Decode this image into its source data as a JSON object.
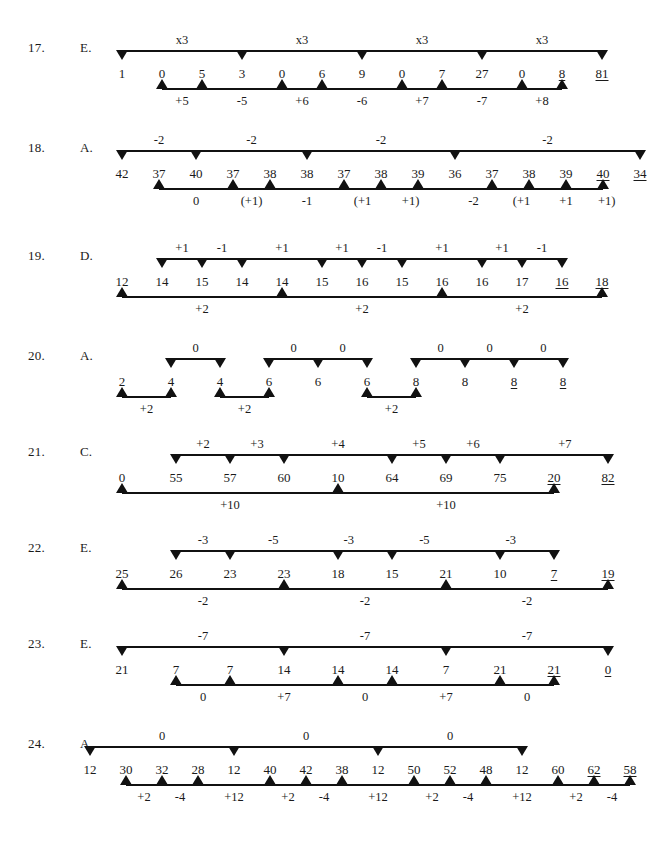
{
  "page": {
    "width": 666,
    "height": 847,
    "background": "#ffffff",
    "ink": "#111111"
  },
  "problems": [
    {
      "number": "17.",
      "answer": "E.",
      "y": 28,
      "seq_left": 122,
      "seq_step": 40,
      "numbers": [
        "1",
        "0",
        "5",
        "3",
        "0",
        "6",
        "9",
        "0",
        "7",
        "27",
        "0",
        "8",
        "81"
      ],
      "underlined": [
        11,
        12
      ],
      "top": {
        "spans": [
          [
            0,
            12
          ]
        ],
        "markers": [
          0,
          3,
          6,
          9,
          12
        ],
        "labels": [
          {
            "text": "x3",
            "at": 1.5
          },
          {
            "text": "x3",
            "at": 4.5
          },
          {
            "text": "x3",
            "at": 7.5
          },
          {
            "text": "x3",
            "at": 10.5
          }
        ]
      },
      "bottom": {
        "spans": [
          [
            1,
            11
          ]
        ],
        "markers": [
          1,
          2,
          4,
          5,
          7,
          8,
          10,
          11
        ],
        "labels": [
          {
            "text": "+5",
            "at": 1.5
          },
          {
            "text": "-5",
            "at": 3
          },
          {
            "text": "+6",
            "at": 4.5
          },
          {
            "text": "-6",
            "at": 6
          },
          {
            "text": "+7",
            "at": 7.5
          },
          {
            "text": "-7",
            "at": 9
          },
          {
            "text": "+8",
            "at": 10.5
          }
        ]
      }
    },
    {
      "number": "18.",
      "answer": "A.",
      "y": 128,
      "seq_left": 122,
      "seq_step": 37,
      "numbers": [
        "42",
        "37",
        "40",
        "37",
        "38",
        "38",
        "37",
        "38",
        "39",
        "36",
        "37",
        "38",
        "39",
        "40",
        "34"
      ],
      "underlined": [
        13,
        14
      ],
      "top": {
        "spans": [
          [
            0,
            14
          ]
        ],
        "markers": [
          0,
          2,
          5,
          9,
          14
        ],
        "labels": [
          {
            "text": "-2",
            "at": 1
          },
          {
            "text": "-2",
            "at": 3.5
          },
          {
            "text": "-2",
            "at": 7
          },
          {
            "text": "-2",
            "at": 11.5
          }
        ]
      },
      "bottom": {
        "spans": [
          [
            1,
            13
          ]
        ],
        "markers": [
          1,
          3,
          4,
          6,
          7,
          8,
          10,
          11,
          12,
          13
        ],
        "labels": [
          {
            "text": "0",
            "at": 2
          },
          {
            "text": "(+1)",
            "at": 3.5
          },
          {
            "text": "-1",
            "at": 5
          },
          {
            "text": "(+1",
            "at": 6.5
          },
          {
            "text": "+1)",
            "at": 7.8
          },
          {
            "text": "-2",
            "at": 9.5
          },
          {
            "text": "(+1",
            "at": 10.8
          },
          {
            "text": "+1",
            "at": 12
          },
          {
            "text": "+1)",
            "at": 13.1
          }
        ]
      }
    },
    {
      "number": "19.",
      "answer": "D.",
      "y": 236,
      "seq_left": 122,
      "seq_step": 40,
      "numbers": [
        "12",
        "14",
        "15",
        "14",
        "14",
        "15",
        "16",
        "15",
        "16",
        "16",
        "17",
        "16",
        "18"
      ],
      "underlined": [
        11,
        12
      ],
      "top": {
        "spans": [
          [
            1,
            11
          ]
        ],
        "markers": [
          1,
          2,
          3,
          5,
          6,
          7,
          9,
          10,
          11
        ],
        "labels": [
          {
            "text": "+1",
            "at": 1.5
          },
          {
            "text": "-1",
            "at": 2.5
          },
          {
            "text": "+1",
            "at": 4
          },
          {
            "text": "+1",
            "at": 5.5
          },
          {
            "text": "-1",
            "at": 6.5
          },
          {
            "text": "+1",
            "at": 8
          },
          {
            "text": "+1",
            "at": 9.5
          },
          {
            "text": "-1",
            "at": 10.5
          }
        ]
      },
      "bottom": {
        "spans": [
          [
            0,
            12
          ]
        ],
        "markers": [
          0,
          4,
          8,
          12
        ],
        "labels": [
          {
            "text": "+2",
            "at": 2
          },
          {
            "text": "+2",
            "at": 6
          },
          {
            "text": "+2",
            "at": 10
          }
        ]
      }
    },
    {
      "number": "20.",
      "answer": "A.",
      "y": 336,
      "seq_left": 122,
      "seq_step": 49,
      "numbers": [
        "2",
        "4",
        "4",
        "6",
        "6",
        "6",
        "8",
        "8",
        "8",
        "8"
      ],
      "underlined": [
        8,
        9
      ],
      "top": {
        "spans": [
          [
            1,
            2
          ],
          [
            3,
            5
          ],
          [
            6,
            9
          ]
        ],
        "markers": [
          1,
          2,
          3,
          4,
          5,
          6,
          7,
          8,
          9
        ],
        "labels": [
          {
            "text": "0",
            "at": 1.5
          },
          {
            "text": "0",
            "at": 3.5
          },
          {
            "text": "0",
            "at": 4.5
          },
          {
            "text": "0",
            "at": 6.5
          },
          {
            "text": "0",
            "at": 7.5
          },
          {
            "text": "0",
            "at": 8.6
          }
        ]
      },
      "bottom": {
        "spans": [
          [
            0,
            1
          ],
          [
            2,
            3
          ],
          [
            5,
            6
          ]
        ],
        "markers": [
          0,
          1,
          2,
          3,
          5,
          6
        ],
        "labels": [
          {
            "text": "+2",
            "at": 0.5
          },
          {
            "text": "+2",
            "at": 2.5
          },
          {
            "text": "+2",
            "at": 5.5
          }
        ]
      }
    },
    {
      "number": "21.",
      "answer": "C.",
      "y": 432,
      "seq_left": 122,
      "seq_step": 54,
      "numbers": [
        "0",
        "55",
        "57",
        "60",
        "10",
        "64",
        "69",
        "75",
        "20",
        "82"
      ],
      "underlined": [
        8,
        9
      ],
      "top": {
        "spans": [
          [
            1,
            9
          ]
        ],
        "markers": [
          1,
          2,
          3,
          5,
          6,
          7,
          9
        ],
        "labels": [
          {
            "text": "+2",
            "at": 1.5
          },
          {
            "text": "+3",
            "at": 2.5
          },
          {
            "text": "+4",
            "at": 4
          },
          {
            "text": "+5",
            "at": 5.5
          },
          {
            "text": "+6",
            "at": 6.5
          },
          {
            "text": "+7",
            "at": 8.2
          }
        ]
      },
      "bottom": {
        "spans": [
          [
            0,
            8
          ]
        ],
        "markers": [
          0,
          4,
          8
        ],
        "labels": [
          {
            "text": "+10",
            "at": 2
          },
          {
            "text": "+10",
            "at": 6
          }
        ]
      }
    },
    {
      "number": "22.",
      "answer": "E.",
      "y": 528,
      "seq_left": 122,
      "seq_step": 54,
      "numbers": [
        "25",
        "26",
        "23",
        "23",
        "18",
        "15",
        "21",
        "10",
        "7",
        "19"
      ],
      "underlined": [
        8,
        9
      ],
      "top": {
        "spans": [
          [
            1,
            8
          ]
        ],
        "markers": [
          1,
          2,
          4,
          5,
          7,
          8
        ],
        "labels": [
          {
            "text": "-3",
            "at": 1.5
          },
          {
            "text": "-5",
            "at": 2.8
          },
          {
            "text": "-3",
            "at": 4.2
          },
          {
            "text": "-5",
            "at": 5.6
          },
          {
            "text": "-3",
            "at": 7.2
          }
        ]
      },
      "bottom": {
        "spans": [
          [
            0,
            9
          ]
        ],
        "markers": [
          0,
          3,
          6,
          9
        ],
        "labels": [
          {
            "text": "-2",
            "at": 1.5
          },
          {
            "text": "-2",
            "at": 4.5
          },
          {
            "text": "-2",
            "at": 7.5
          }
        ]
      }
    },
    {
      "number": "23.",
      "answer": "E.",
      "y": 624,
      "seq_left": 122,
      "seq_step": 54,
      "numbers": [
        "21",
        "7",
        "7",
        "14",
        "14",
        "14",
        "7",
        "21",
        "21",
        "0"
      ],
      "underlined": [
        8,
        9
      ],
      "top": {
        "spans": [
          [
            0,
            9
          ]
        ],
        "markers": [
          0,
          3,
          6,
          9
        ],
        "labels": [
          {
            "text": "-7",
            "at": 1.5
          },
          {
            "text": "-7",
            "at": 4.5
          },
          {
            "text": "-7",
            "at": 7.5
          }
        ]
      },
      "bottom": {
        "spans": [
          [
            1,
            8
          ]
        ],
        "markers": [
          1,
          2,
          4,
          5,
          7,
          8
        ],
        "labels": [
          {
            "text": "0",
            "at": 1.5
          },
          {
            "text": "+7",
            "at": 3
          },
          {
            "text": "0",
            "at": 4.5
          },
          {
            "text": "+7",
            "at": 6
          },
          {
            "text": "0",
            "at": 7.5
          }
        ]
      }
    },
    {
      "number": "24.",
      "answer": "A.",
      "y": 724,
      "seq_left": 90,
      "seq_step": 36,
      "numbers": [
        "12",
        "30",
        "32",
        "28",
        "12",
        "40",
        "42",
        "38",
        "12",
        "50",
        "52",
        "48",
        "12",
        "60",
        "62",
        "58"
      ],
      "underlined": [
        14,
        15
      ],
      "top": {
        "spans": [
          [
            0,
            12
          ]
        ],
        "markers": [
          0,
          4,
          8,
          12
        ],
        "labels": [
          {
            "text": "0",
            "at": 2
          },
          {
            "text": "0",
            "at": 6
          },
          {
            "text": "0",
            "at": 10
          }
        ]
      },
      "bottom": {
        "spans": [
          [
            1,
            15
          ]
        ],
        "markers": [
          1,
          2,
          3,
          5,
          6,
          7,
          9,
          10,
          11,
          13,
          14,
          15
        ],
        "labels": [
          {
            "text": "+2",
            "at": 1.5
          },
          {
            "text": "-4",
            "at": 2.5
          },
          {
            "text": "+12",
            "at": 4
          },
          {
            "text": "+2",
            "at": 5.5
          },
          {
            "text": "-4",
            "at": 6.5
          },
          {
            "text": "+12",
            "at": 8
          },
          {
            "text": "+2",
            "at": 9.5
          },
          {
            "text": "-4",
            "at": 10.5
          },
          {
            "text": "+12",
            "at": 12
          },
          {
            "text": "+2",
            "at": 13.5
          },
          {
            "text": "-4",
            "at": 14.5
          }
        ]
      }
    }
  ]
}
